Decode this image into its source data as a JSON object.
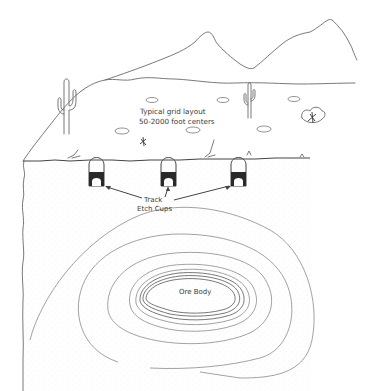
{
  "diagram": {
    "type": "cross-section illustration",
    "scene": "desert landscape with mountains, cacti, and a subsurface ore body",
    "labels": {
      "grid_line1": "Typical grid layout",
      "grid_line2": "50-2000 foot centers",
      "cups_line1": "Track",
      "cups_line2": "Etch Cups",
      "ore_body": "Ore Body"
    },
    "elements": {
      "surface_pits": 6,
      "track_etch_cups": 3,
      "cacti": 2,
      "contour_rings_outer": 3,
      "contour_rings_inner": 6
    },
    "colors": {
      "line": "#6a6a6a",
      "ink": "#3a3a3a",
      "cup_fill": "#2a2a2a",
      "background": "#ffffff",
      "stipple": "#bdbdbd"
    }
  }
}
